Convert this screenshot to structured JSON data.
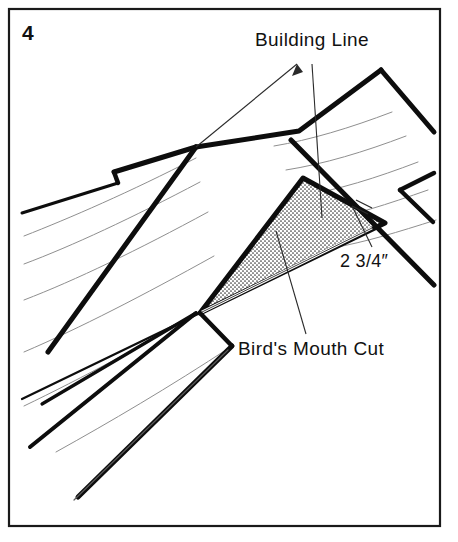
{
  "figure": {
    "number": "4",
    "caption_number_label": "4",
    "type": "technical-line-drawing"
  },
  "frame": {
    "border_color": "#1a1a1a",
    "background_color": "#ffffff",
    "border_width_px": 2
  },
  "annotations": [
    {
      "id": "building-line",
      "text": "Building Line",
      "leader_count": 2
    },
    {
      "id": "dimension",
      "text": "2 3/4″",
      "leader_count": 1
    },
    {
      "id": "birds-mouth",
      "text": "Bird's Mouth Cut",
      "leader_count": 1
    }
  ],
  "labels": {
    "building_line": "Building Line",
    "dimension": "2 3/4″",
    "birds_mouth": "Bird's Mouth Cut"
  },
  "colors": {
    "ink": "#111111",
    "heavy_line": "#0d0d0d",
    "thin_line": "#8a8a8a",
    "leader_line": "#2a2a2a",
    "stipple_fill": "#d4d4d4",
    "paper": "#ffffff"
  },
  "drawing": {
    "stipple_region_name": "birds-mouth-cut-wedge",
    "heavy_stroke_px": 5,
    "thin_stroke_px": 1,
    "leader_stroke_px": 1
  }
}
